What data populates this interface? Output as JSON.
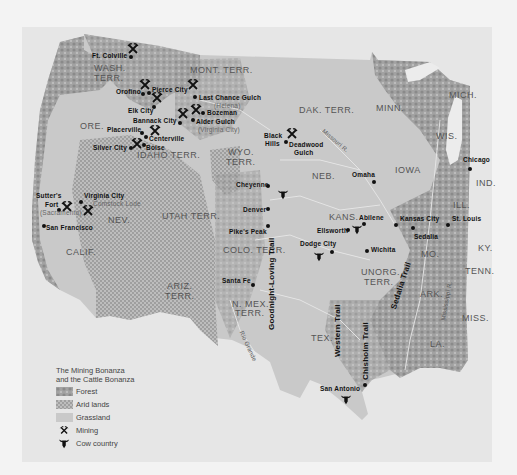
{
  "legend": {
    "title_line1": "The Mining Bonanza",
    "title_line2": "and the Cattle Bonanza",
    "items": [
      {
        "label": "Forest",
        "icon": "forest-swatch",
        "color": "#9a9a9a"
      },
      {
        "label": "Arid lands",
        "icon": "arid-swatch",
        "color": "#b5b5b5"
      },
      {
        "label": "Grassland",
        "icon": "grassland-swatch",
        "color": "#c9c9c9"
      },
      {
        "label": "Mining",
        "icon": "pick-and-shovel-icon"
      },
      {
        "label": "Cow country",
        "icon": "steer-head-icon"
      }
    ]
  },
  "states": {
    "wash1": "WASH.",
    "wash2": "TERR.",
    "mont": "MONT. TERR.",
    "ore": "ORE.",
    "idaho": "IDAHO TERR.",
    "wyo1": "WYO.",
    "wyo2": "TERR.",
    "dak": "DAK. TERR.",
    "minn": "MINN.",
    "mich": "MICH.",
    "wis": "WIS.",
    "iowa": "IOWA",
    "ind": "IND.",
    "ill": "ILL.",
    "neb": "NEB.",
    "kans": "KANS.",
    "nev": "NEV.",
    "utah": "UTAH TERR.",
    "calif": "CALIF.",
    "colo": "COLO. TERR.",
    "ariz1": "ARIZ.",
    "ariz2": "TERR.",
    "nmex1": "N. MEX.",
    "nmex2": "TERR.",
    "mo": "MO.",
    "ky": "KY.",
    "tenn": "TENN.",
    "ark": "ARK.",
    "miss": "MISS.",
    "la": "LA.",
    "tex": "TEX.",
    "unorg1": "UNORG.",
    "unorg2": "TERR."
  },
  "places": {
    "ft_colville": "Ft. Colville",
    "orofino": "Orofino",
    "pierce_city": "Pierce City",
    "elk_city": "Elk City",
    "last_chance": "Last Chance Gulch",
    "helena": "(Helena)",
    "bozeman": "Bozeman",
    "bannack": "Bannack City",
    "alder": "Alder Gulch",
    "virginia_city_mt": "(Virginia City)",
    "placerville": "Placerville",
    "centerville": "Centerville",
    "silver_city": "Silver City",
    "boise": "Boise",
    "black_hills1": "Black",
    "black_hills2": "Hills",
    "deadwood1": "Deadwood",
    "deadwood2": "Gulch",
    "sutters1": "Sutter's",
    "sutters2": "Fort",
    "sacramento": "(Sacramento)",
    "virginia_city_nv": "Virginia City",
    "comstock": "Comstock Lode",
    "san_francisco": "San Francisco",
    "cheyenne": "Cheyenne",
    "denver": "Denver",
    "pikes_peak": "Pike's Peak",
    "santa_fe": "Santa Fe",
    "omaha": "Omaha",
    "chicago": "Chicago",
    "abilene": "Abilene",
    "ellsworth": "Ellsworth",
    "dodge_city": "Dodge City",
    "wichita": "Wichita",
    "kansas_city": "Kansas City",
    "sedalia": "Sedalia",
    "st_louis": "St. Louis",
    "san_antonio": "San Antonio"
  },
  "trails": {
    "goodnight": "Goodnight-Loving Trail",
    "western": "Western Trail",
    "chisholm": "Chisholm Trail",
    "sedalia": "Sedalia Trail"
  },
  "rivers": {
    "missouri": "Missouri R.",
    "mississippi": "Mississippi R.",
    "rio_grande": "Rio Grande"
  }
}
